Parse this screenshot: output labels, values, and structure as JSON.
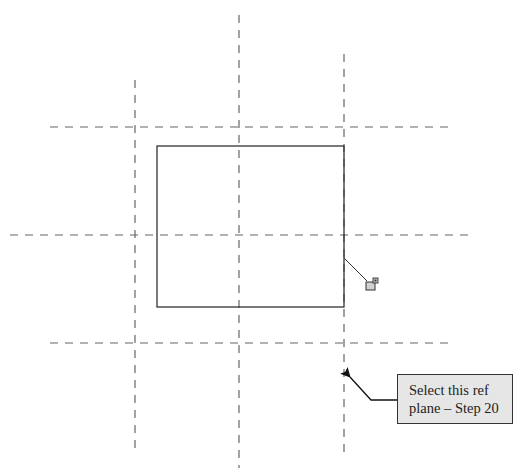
{
  "diagram": {
    "type": "cad-sketch-reference-planes",
    "colors": {
      "background": "#ffffff",
      "ref_plane": "#666666",
      "sketch_line": "#333333",
      "callout_fill": "#e6e6e6",
      "callout_border": "#333333"
    },
    "ref_planes": {
      "vertical": [
        {
          "id": "left",
          "x": 135,
          "y1": 80,
          "y2": 452
        },
        {
          "id": "center",
          "x": 239,
          "y1": 15,
          "y2": 468
        },
        {
          "id": "right",
          "x": 344,
          "y1": 54,
          "y2": 456
        }
      ],
      "horizontal": [
        {
          "id": "top",
          "y": 127,
          "x1": 50,
          "x2": 452
        },
        {
          "id": "middle",
          "y": 235,
          "x1": 10,
          "x2": 472
        },
        {
          "id": "bottom",
          "y": 343,
          "x1": 50,
          "x2": 452
        }
      ]
    },
    "rectangle": {
      "x": 157,
      "y": 146,
      "width": 187,
      "height": 161
    },
    "lock_icon": {
      "name": "lock-icon",
      "leader_from": [
        344,
        258
      ],
      "leader_to": [
        368,
        281
      ]
    },
    "callout": {
      "lines": [
        "Select this ref",
        "plane – Step 20"
      ],
      "arrow_tip": [
        348,
        375
      ],
      "arrow_elbow": [
        371,
        400
      ],
      "arrow_end": [
        397,
        400
      ]
    }
  }
}
